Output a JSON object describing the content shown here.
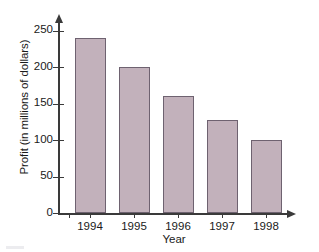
{
  "chart_data": {
    "type": "bar",
    "title": "",
    "xlabel": "Year",
    "ylabel": "Profit (in millions of dollars)",
    "categories": [
      "1994",
      "1995",
      "1996",
      "1997",
      "1998"
    ],
    "values": [
      240,
      200,
      160,
      128,
      100
    ],
    "ylim": [
      0,
      250
    ],
    "ytick_labels": [
      "0",
      "50",
      "100",
      "150",
      "200",
      "250"
    ],
    "ytick_values": [
      0,
      50,
      100,
      150,
      200,
      250
    ],
    "grid": false,
    "legend": false,
    "legend_position": "none",
    "bar_color": "#c2b1bb",
    "bar_edge_color": "#6e6270",
    "axis_color": "#3a3a3a",
    "axis_arrowheads": true
  }
}
